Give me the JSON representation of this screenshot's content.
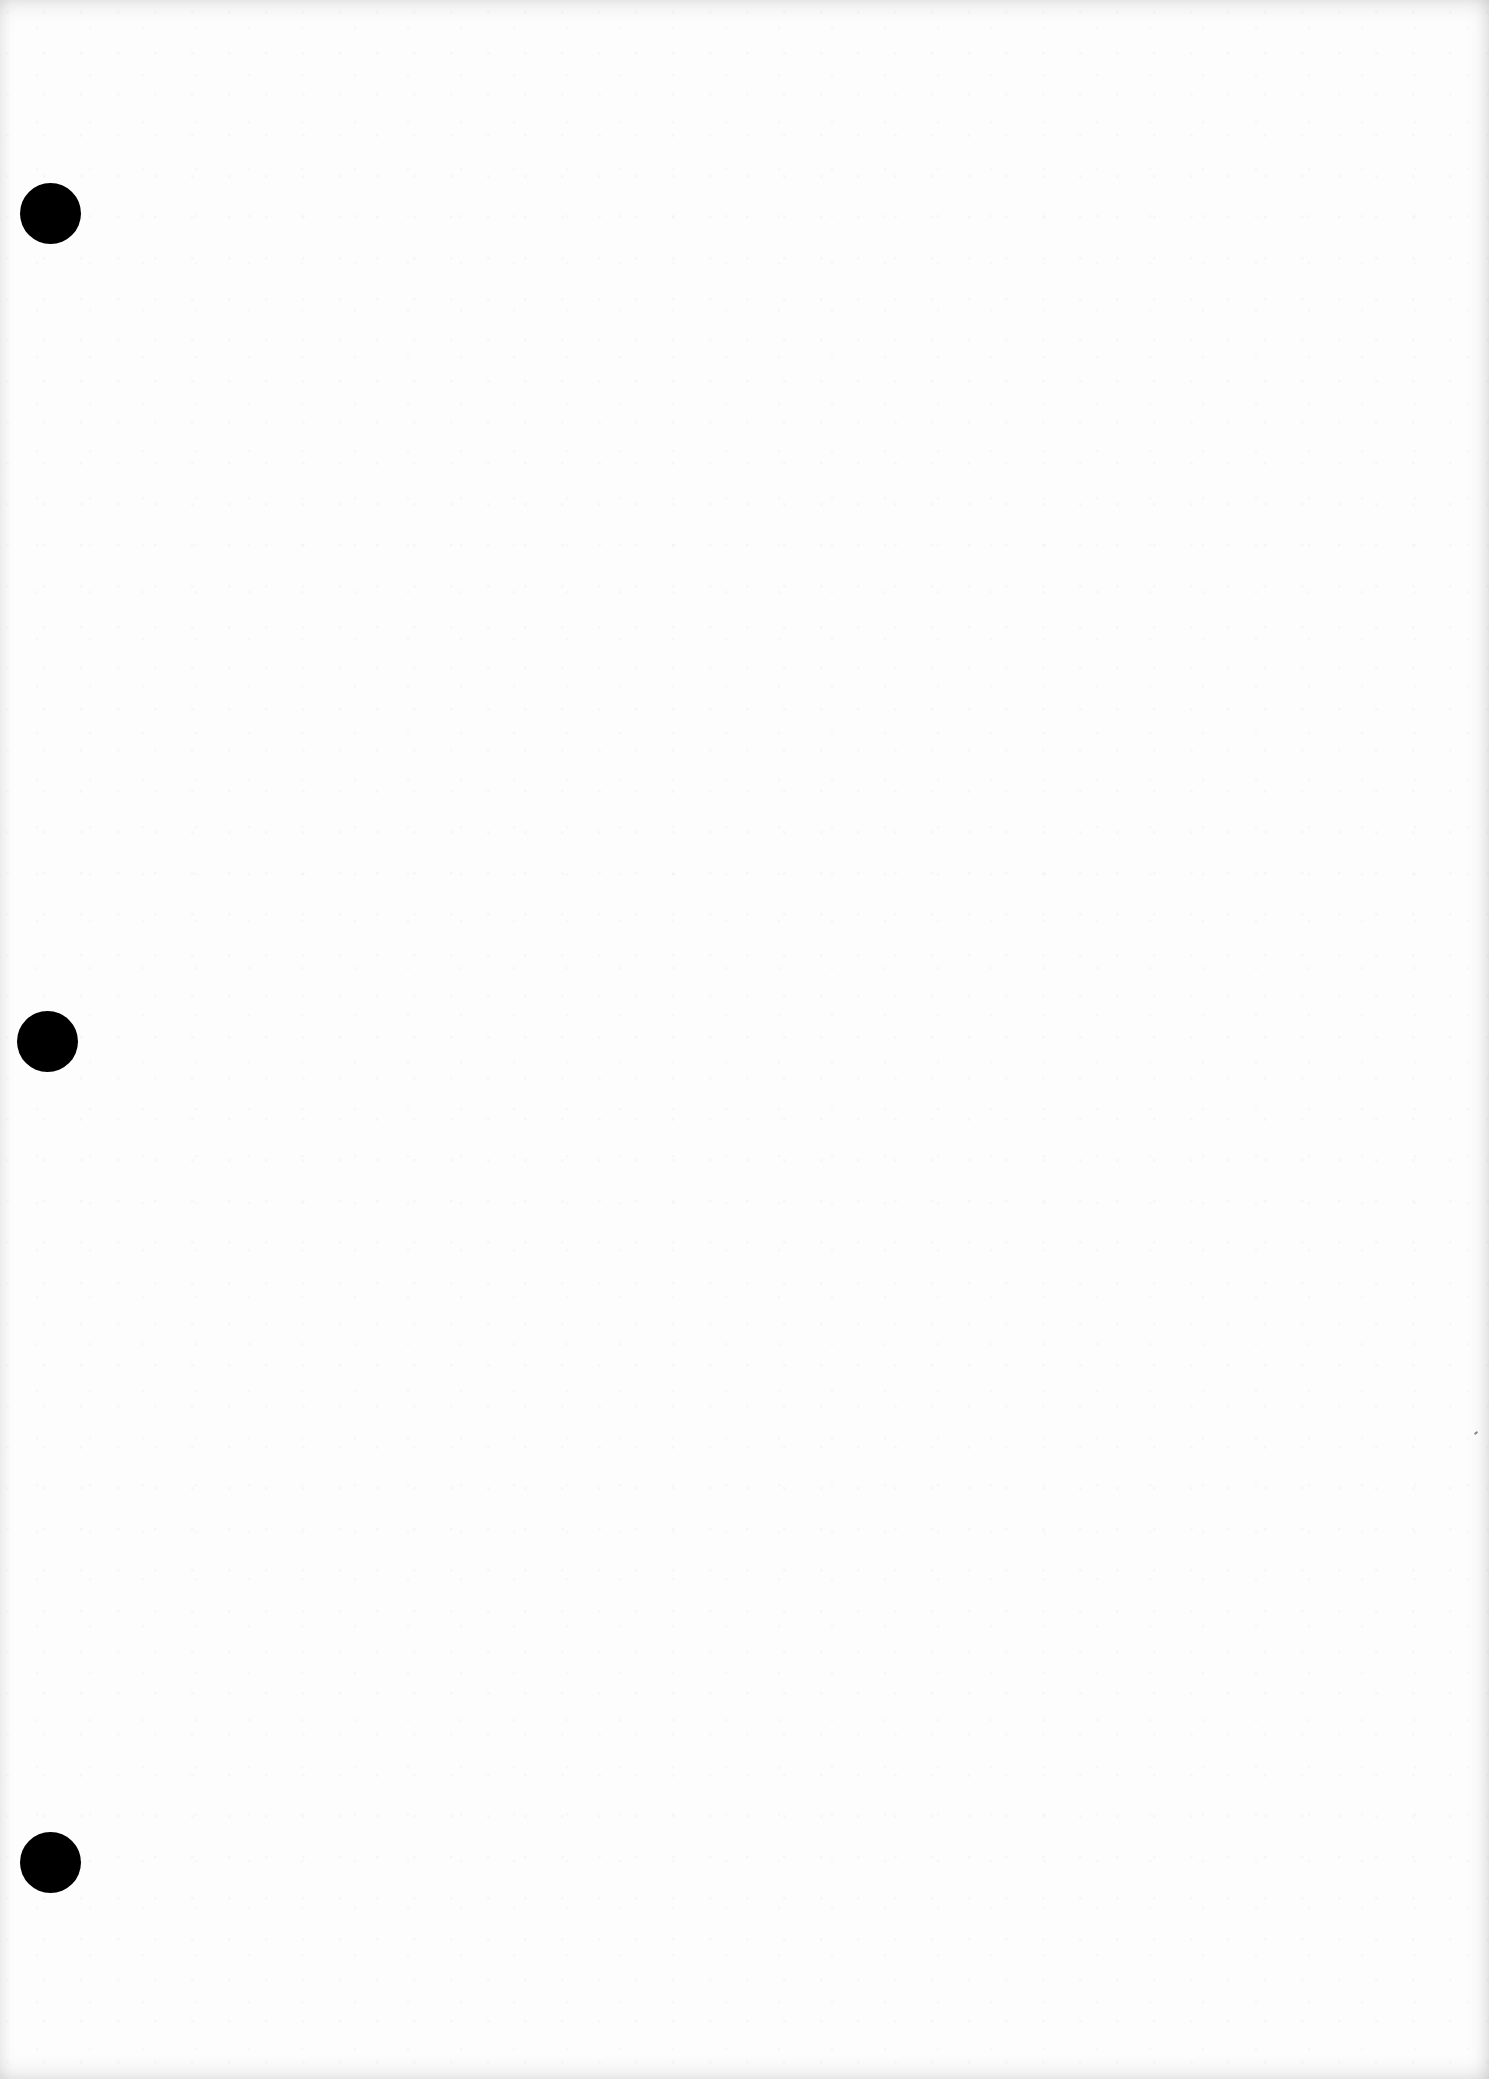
{
  "document": {
    "type": "blank-page-scan",
    "background_color": "#fdfdfd",
    "text": "",
    "punch_holes": [
      {
        "cx": 50,
        "cy": 213,
        "diameter": 61,
        "color": "#000000"
      },
      {
        "cx": 47,
        "cy": 1041,
        "diameter": 61,
        "color": "#000000"
      },
      {
        "cx": 50,
        "cy": 1862,
        "diameter": 61,
        "color": "#000000"
      }
    ]
  }
}
